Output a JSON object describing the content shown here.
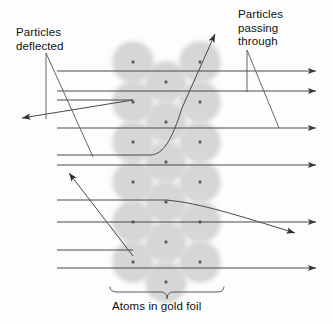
{
  "diagram": {
    "labels": {
      "deflected": "Particles\ndeflected",
      "passing_through": "Particles\npassing\nthrough",
      "caption": "Atoms in gold foil"
    },
    "colors": {
      "atom_fill": "#d6d6d6",
      "nucleus": "#555555",
      "ray": "#4a4a4a",
      "text": "#111111",
      "background": "#fdfdfd"
    },
    "geometry": {
      "atom_radius": 21,
      "atom_columns_x": [
        133,
        166,
        200
      ],
      "foil_left": 110,
      "foil_right": 223,
      "beam_left_x": 57,
      "beam_right_x": 316
    },
    "atoms": [
      {
        "cx": 133,
        "cy": 62
      },
      {
        "cx": 200,
        "cy": 62
      },
      {
        "cx": 166,
        "cy": 82
      },
      {
        "cx": 133,
        "cy": 102
      },
      {
        "cx": 200,
        "cy": 102
      },
      {
        "cx": 166,
        "cy": 122
      },
      {
        "cx": 133,
        "cy": 142
      },
      {
        "cx": 200,
        "cy": 142
      },
      {
        "cx": 166,
        "cy": 162
      },
      {
        "cx": 133,
        "cy": 182
      },
      {
        "cx": 200,
        "cy": 182
      },
      {
        "cx": 166,
        "cy": 202
      },
      {
        "cx": 133,
        "cy": 222
      },
      {
        "cx": 200,
        "cy": 222
      },
      {
        "cx": 166,
        "cy": 242
      },
      {
        "cx": 133,
        "cy": 262
      },
      {
        "cx": 200,
        "cy": 262
      },
      {
        "cx": 166,
        "cy": 282
      }
    ],
    "beams_straight": [
      {
        "name": "beam-1",
        "y": 71,
        "x1": 57,
        "x2": 316,
        "arrow": true
      },
      {
        "name": "beam-2",
        "y": 91,
        "x1": 57,
        "x2": 316,
        "arrow": true
      },
      {
        "name": "beam-3",
        "y": 100,
        "x1": 57,
        "x2": 133,
        "arrow": false
      },
      {
        "name": "beam-4",
        "y": 128,
        "x1": 57,
        "x2": 316,
        "arrow": true
      },
      {
        "name": "beam-5",
        "y": 155,
        "x1": 57,
        "x2": 150,
        "arrow": false
      },
      {
        "name": "beam-6",
        "y": 165,
        "x1": 57,
        "x2": 316,
        "arrow": true
      },
      {
        "name": "beam-7",
        "y": 200,
        "x1": 57,
        "x2": 166,
        "arrow": false
      },
      {
        "name": "beam-8",
        "y": 222,
        "x1": 57,
        "x2": 316,
        "arrow": true
      },
      {
        "name": "beam-9",
        "y": 250,
        "x1": 57,
        "x2": 133,
        "arrow": false
      },
      {
        "name": "beam-10",
        "y": 268,
        "x1": 57,
        "x2": 316,
        "arrow": true
      }
    ],
    "deflected_paths": [
      {
        "name": "backscatter-ray",
        "d": "M 133 100 L 22 118",
        "arrow_at": "end"
      },
      {
        "name": "large-angle-ray",
        "d": "M 150 155 C 163 155, 172 140, 182 108 L 215 34",
        "arrow_at": "end"
      },
      {
        "name": "small-angle-ray",
        "d": "M 166 200 C 200 203, 240 216, 295 233",
        "arrow_at": "end"
      },
      {
        "name": "upward-ray",
        "d": "M 133 256 L 69 173",
        "arrow_at": "end"
      }
    ],
    "leader_lines": [
      {
        "name": "leader-deflected-vertical",
        "d": "M 46 53 L 46 119"
      },
      {
        "name": "leader-deflected-diagonal",
        "d": "M 46 53 L 93 157"
      },
      {
        "name": "leader-passing-vertical",
        "d": "M 247 50 L 247 92"
      },
      {
        "name": "leader-passing-diagonal",
        "d": "M 247 50 L 279 128"
      }
    ],
    "brace": {
      "name": "foil-brace",
      "left_x": 110,
      "right_x": 224,
      "y": 292,
      "tip_y": 299,
      "center_x": 167
    }
  }
}
